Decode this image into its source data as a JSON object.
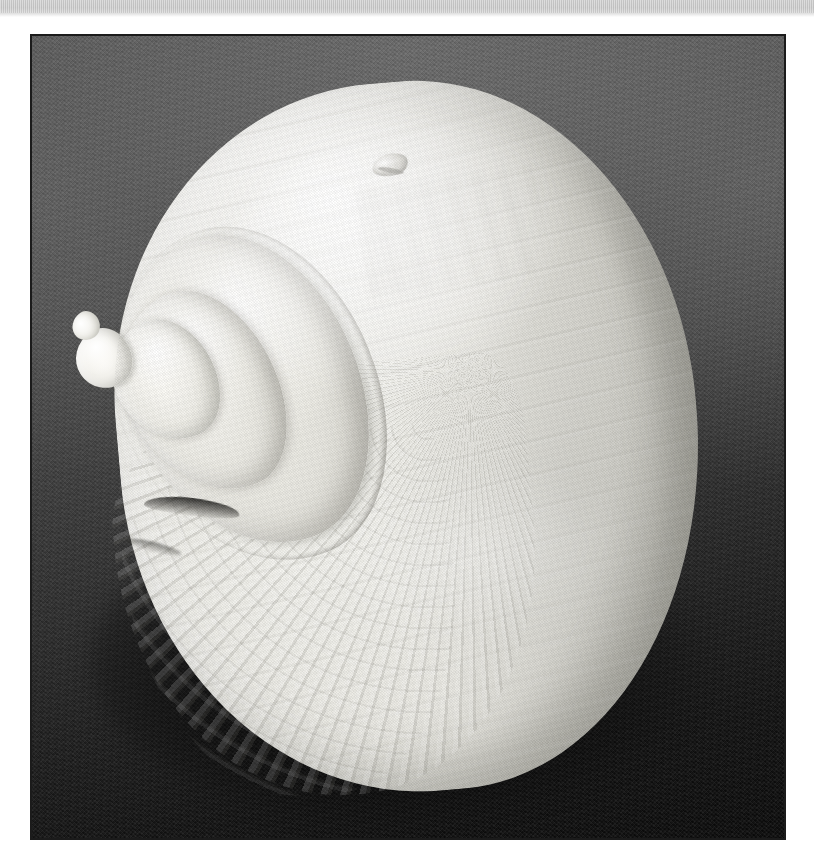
{
  "page": {
    "width": 814,
    "height": 863,
    "background_color": "#ffffff",
    "content_type": "scanned-photograph"
  },
  "top_band": {
    "name": "scan-edge-band",
    "color": "#c9c9c9",
    "height_px": 14,
    "text": ""
  },
  "photo": {
    "frame": {
      "x": 30,
      "y": 34,
      "width": 756,
      "height": 806,
      "border_color": "#1b1b1b"
    },
    "backdrop": {
      "name": "dark-fabric-backdrop",
      "description": "dark gray textured felt/fabric, lit from upper area, falling to near-black at the bottom",
      "color_top": "#5a5a5a",
      "color_bottom": "#0a0a0a",
      "texture": "woven-noise"
    },
    "subject": {
      "name": "gastropod-shell",
      "common_description": "large white moon-snail style sea shell, apertural/dorsal view",
      "color_light": "#f5f5f0",
      "color_mid": "#e8e7e1",
      "color_shadow": "#b2b1aa",
      "orientation": "apex to the left, body whorl filling the right",
      "features": [
        {
          "name": "body-whorl",
          "description": "large smooth rounded body whorl occupying most of the frame"
        },
        {
          "name": "shoulder-whorl",
          "description": "broad concentric shoulder whorl left of centre"
        },
        {
          "name": "whorl-2",
          "description": "second spire whorl"
        },
        {
          "name": "whorl-3",
          "description": "third spire whorl"
        },
        {
          "name": "apex",
          "description": "small knobby protoconch apex at far left"
        },
        {
          "name": "suture-notch",
          "description": "dark recessed suture groove at the base of the spire"
        },
        {
          "name": "growth-ribs",
          "description": "fine radial growth ribbing along the lower-left flank"
        },
        {
          "name": "blemish",
          "description": "small chip/blemish near the top of the body whorl"
        },
        {
          "name": "ghost-marking",
          "description": "faint pale stain / ghosted marking on the upper body whorl"
        },
        {
          "name": "specular-highlight",
          "description": "broad soft highlight across the upper left of the body whorl"
        }
      ]
    }
  },
  "caption": {
    "text": ""
  }
}
